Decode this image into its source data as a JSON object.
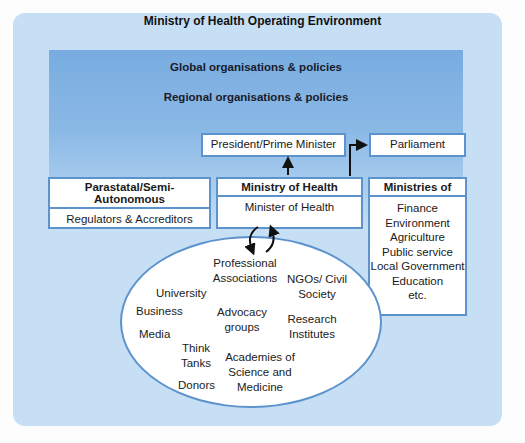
{
  "title": "Ministry of Health Operating Environment",
  "layers": {
    "global": "Global organisations & policies",
    "regional": "Regional organisations & policies"
  },
  "president": "President/Prime Minister",
  "parliament": "Parliament",
  "parastatal": {
    "header": "Parastatal/Semi-Autonomous",
    "body": "Regulators & Accreditors"
  },
  "moh": {
    "header": "Ministry of Health",
    "body": "Minister of Health"
  },
  "ministries": {
    "header": "Ministries of",
    "items": [
      "Finance",
      "Environment",
      "Agriculture",
      "Public service",
      "Local Government",
      "Education",
      "etc."
    ]
  },
  "stakeholders": {
    "professional": "Professional Associations",
    "ngos": "NGOs/ Civil Society",
    "university": "University",
    "business": "Business",
    "advocacy": "Advocacy groups",
    "research": "Research Institutes",
    "media": "Media",
    "think_tanks": "Think Tanks",
    "academies": "Academies of Science and Medicine",
    "donors": "Donors"
  },
  "colors": {
    "outer_bg": "#c6dff5",
    "band_top": "#78ace0",
    "border": "#5d93cc",
    "arrow": "#111111"
  }
}
